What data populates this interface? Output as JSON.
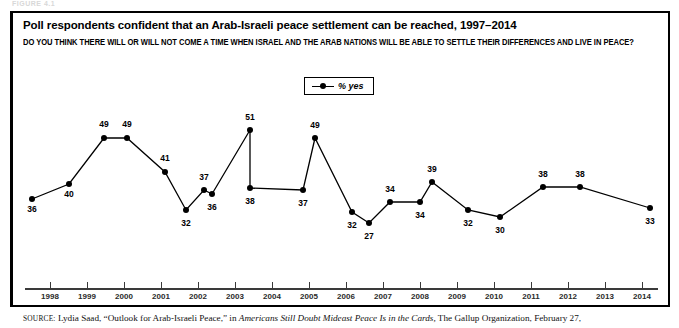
{
  "figure": {
    "label": "FIGURE 4.1"
  },
  "chart_data": {
    "type": "line",
    "title": "Poll respondents confident that an Arab-Israeli peace settlement can be reached, 1997–2014",
    "subtitle": "DO YOU THINK THERE WILL OR WILL NOT COME A TIME WHEN ISRAEL AND THE ARAB NATIONS WILL BE ABLE TO SETTLE THEIR DIFFERENCES AND LIVE IN PEACE?",
    "xlabel": "",
    "ylabel": "",
    "ylim": [
      20,
      55
    ],
    "grid": false,
    "legend_position": "top-center",
    "legend": [
      "% yes"
    ],
    "axis_tick_labels": [
      "1998",
      "1999",
      "2000",
      "2001",
      "2002",
      "2003",
      "2004",
      "2005",
      "2006",
      "2007",
      "2008",
      "2009",
      "2010",
      "2011",
      "2012",
      "2013",
      "2014"
    ],
    "series": [
      {
        "name": "% yes",
        "values": [
          36,
          40,
          49,
          49,
          41,
          32,
          37,
          36,
          51,
          38,
          37,
          49,
          32,
          27,
          34,
          34,
          39,
          32,
          30,
          38,
          38,
          33
        ],
        "points": [
          {
            "label": "36",
            "x": 32,
            "y": 199,
            "label_dx": 0,
            "label_dy": 10
          },
          {
            "label": "40",
            "x": 69,
            "y": 184,
            "label_dx": 0,
            "label_dy": 10
          },
          {
            "label": "49",
            "x": 104,
            "y": 138,
            "label_dx": 0,
            "label_dy": -14
          },
          {
            "label": "49",
            "x": 127,
            "y": 138,
            "label_dx": 0,
            "label_dy": -14
          },
          {
            "label": "41",
            "x": 165,
            "y": 172,
            "label_dx": 0,
            "label_dy": -14
          },
          {
            "label": "32",
            "x": 186,
            "y": 210,
            "label_dx": 0,
            "label_dy": 13
          },
          {
            "label": "37",
            "x": 204,
            "y": 190,
            "label_dx": 0,
            "label_dy": -13
          },
          {
            "label": "36",
            "x": 212,
            "y": 194,
            "label_dx": 0,
            "label_dy": 13
          },
          {
            "label": "51",
            "x": 250,
            "y": 130,
            "label_dx": 0,
            "label_dy": -13
          },
          {
            "label": "38",
            "x": 250,
            "y": 188,
            "label_dx": 0,
            "label_dy": 13
          },
          {
            "label": "37",
            "x": 303,
            "y": 190,
            "label_dx": 0,
            "label_dy": 13
          },
          {
            "label": "49",
            "x": 315,
            "y": 138,
            "label_dx": 0,
            "label_dy": -13
          },
          {
            "label": "32",
            "x": 352,
            "y": 212,
            "label_dx": 0,
            "label_dy": 13
          },
          {
            "label": "27",
            "x": 369,
            "y": 223,
            "label_dx": 0,
            "label_dy": 13
          },
          {
            "label": "34",
            "x": 390,
            "y": 202,
            "label_dx": 0,
            "label_dy": -13
          },
          {
            "label": "34",
            "x": 420,
            "y": 202,
            "label_dx": 0,
            "label_dy": 13
          },
          {
            "label": "39",
            "x": 432,
            "y": 182,
            "label_dx": 0,
            "label_dy": -13
          },
          {
            "label": "32",
            "x": 468,
            "y": 210,
            "label_dx": 0,
            "label_dy": 13
          },
          {
            "label": "30",
            "x": 500,
            "y": 217,
            "label_dx": 0,
            "label_dy": 13
          },
          {
            "label": "38",
            "x": 543,
            "y": 187,
            "label_dx": 0,
            "label_dy": -13
          },
          {
            "label": "38",
            "x": 580,
            "y": 187,
            "label_dx": 0,
            "label_dy": -13
          },
          {
            "label": "33",
            "x": 650,
            "y": 208,
            "label_dx": 0,
            "label_dy": 13
          }
        ]
      }
    ],
    "tick_positions": [
      50,
      87,
      124,
      161,
      198,
      235,
      272,
      309,
      346,
      383,
      420,
      457,
      494,
      531,
      568,
      605,
      642
    ]
  },
  "source": {
    "prefix": "SOURCE:",
    "text_before_italic": " Lydia Saad, “Outlook for Arab-Israeli Peace,” in ",
    "italic_title": "Americans Still Doubt Mideast Peace Is in the Cards,",
    "text_after_italic": " The Gallup Organization, February 27,"
  }
}
